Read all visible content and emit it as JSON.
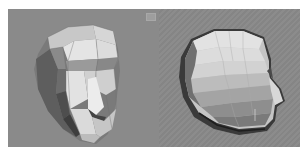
{
  "viewports": [
    {
      "id": "left",
      "label": "Perspective",
      "view": "three-quarter front",
      "shading": "flat shaded with wireframe edges",
      "background_color": "#8a8a8a",
      "subject": "low-poly head mesh"
    },
    {
      "id": "right",
      "label": "Perspective",
      "view": "side profile (right)",
      "shading": "flat shaded",
      "background_color": "#8a8a8a",
      "subject": "low-poly head mesh"
    }
  ],
  "colors": {
    "page_background": "#ffffff",
    "viewport_background": "#8a8a8a",
    "mesh_light": "#e6e6e6",
    "mesh_mid": "#bdbdbd",
    "mesh_dark": "#5a5a5a",
    "mesh_edge": "#6f6f6f"
  }
}
